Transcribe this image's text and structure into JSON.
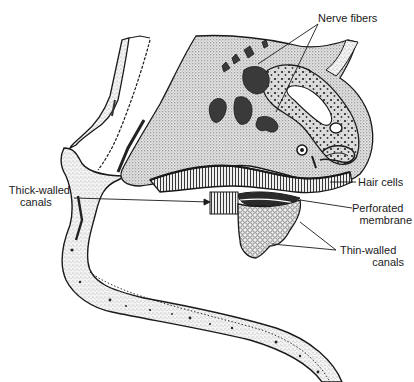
{
  "figure": {
    "type": "anatomical line drawing (stippled cross-section)",
    "colors": {
      "ink": "#1a1a1a",
      "background": "#ffffff",
      "stipple_light": "#e6e6e6",
      "stipple_mid": "#c8c8c8",
      "dark_mass": "#3a3a3a"
    }
  },
  "labels": {
    "nerve_fibers": "Nerve fibers",
    "hair_cells": "Hair cells",
    "thick_walled": {
      "line1": "Thick-walled",
      "line2": "canals"
    },
    "perforated": {
      "line1": "Perforated",
      "line2": "membrane"
    },
    "thin_walled": {
      "line1": "Thin-walled",
      "line2": "canals"
    }
  }
}
